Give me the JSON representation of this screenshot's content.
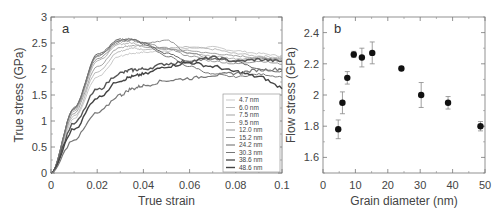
{
  "chart_data": [
    {
      "type": "line",
      "panel_label": "a",
      "title": "",
      "xlabel": "True strain",
      "ylabel": "True stress (GPa)",
      "xlim": [
        0,
        0.1
      ],
      "ylim": [
        0,
        3
      ],
      "xticks": [
        "0",
        "0.02",
        "0.04",
        "0.06",
        "0.08",
        "0.1"
      ],
      "yticks": [
        "0",
        "0.5",
        "1",
        "1.5",
        "2",
        "2.5",
        "3"
      ],
      "grid": false,
      "legend_position": "lower right",
      "x": [
        0,
        0.01,
        0.02,
        0.03,
        0.035,
        0.04,
        0.05,
        0.06,
        0.07,
        0.08,
        0.09,
        0.1
      ],
      "series": [
        {
          "name": "4.7 nm",
          "color": "#bbbbbb",
          "width": 0.8,
          "values": [
            0,
            1.05,
            1.85,
            2.25,
            2.3,
            2.32,
            2.35,
            2.4,
            2.42,
            2.35,
            2.3,
            2.25
          ]
        },
        {
          "name": "6.0 nm",
          "color": "#aaaaaa",
          "width": 0.8,
          "values": [
            0,
            1.1,
            1.95,
            2.35,
            2.4,
            2.38,
            2.4,
            2.42,
            2.38,
            2.3,
            2.25,
            2.22
          ]
        },
        {
          "name": "7.5 nm",
          "color": "#999999",
          "width": 0.9,
          "values": [
            0,
            1.15,
            2.05,
            2.42,
            2.45,
            2.43,
            2.38,
            2.35,
            2.3,
            2.25,
            2.22,
            2.2
          ]
        },
        {
          "name": "9.5 nm",
          "color": "#a0a0a0",
          "width": 0.8,
          "values": [
            0,
            1.2,
            2.15,
            2.48,
            2.5,
            2.45,
            2.4,
            2.3,
            2.25,
            2.2,
            2.2,
            2.18
          ]
        },
        {
          "name": "12.0 nm",
          "color": "#8a8a8a",
          "width": 0.9,
          "values": [
            0,
            1.22,
            2.2,
            2.52,
            2.55,
            2.5,
            2.55,
            2.3,
            2.2,
            2.15,
            2.2,
            2.15
          ]
        },
        {
          "name": "15.2 nm",
          "color": "#909090",
          "width": 0.9,
          "values": [
            0,
            1.25,
            2.25,
            2.55,
            2.57,
            2.5,
            2.4,
            2.25,
            2.15,
            2.1,
            2.15,
            2.1
          ]
        },
        {
          "name": "24.2 nm",
          "color": "#666666",
          "width": 1.0,
          "values": [
            0,
            1.25,
            2.28,
            2.57,
            2.58,
            2.5,
            2.3,
            2.15,
            2.2,
            2.15,
            2.0,
            1.95
          ]
        },
        {
          "name": "30.3 nm",
          "color": "#777777",
          "width": 1.0,
          "values": [
            0,
            1.25,
            2.25,
            2.55,
            2.57,
            2.48,
            2.25,
            2.05,
            1.9,
            1.85,
            1.9,
            1.85
          ]
        },
        {
          "name": "38.6 nm",
          "color": "#555555",
          "width": 1.4,
          "values": [
            0,
            0.95,
            1.6,
            1.92,
            1.98,
            2.0,
            2.1,
            2.15,
            2.22,
            2.15,
            2.18,
            2.15
          ]
        },
        {
          "name": "48.6 nm",
          "color": "#444444",
          "width": 1.4,
          "values": [
            0,
            0.85,
            1.45,
            1.78,
            1.85,
            1.9,
            2.05,
            2.12,
            2.05,
            1.95,
            1.85,
            1.65
          ]
        },
        {
          "name": "(lowest curve)",
          "color": "#777777",
          "width": 1.2,
          "values": [
            0,
            0.65,
            1.15,
            1.5,
            1.62,
            1.68,
            1.78,
            1.82,
            1.88,
            1.92,
            1.98,
            2.0
          ]
        }
      ]
    },
    {
      "type": "scatter",
      "panel_label": "b",
      "title": "",
      "xlabel": "Grain diameter (nm)",
      "ylabel": "Flow stress (GPa)",
      "xlim": [
        0,
        50
      ],
      "ylim": [
        1.5,
        2.5
      ],
      "xticks": [
        "0",
        "10",
        "20",
        "30",
        "40",
        "50"
      ],
      "yticks": [
        "1.6",
        "1.8",
        "2",
        "2.2",
        "2.4"
      ],
      "grid": false,
      "x": [
        4.7,
        6.0,
        7.5,
        9.5,
        12.0,
        15.2,
        24.2,
        30.3,
        38.6,
        48.6
      ],
      "values": [
        1.78,
        1.95,
        2.11,
        2.26,
        2.24,
        2.27,
        2.17,
        2.0,
        1.95,
        1.8
      ],
      "errors": [
        0.06,
        0.07,
        0.04,
        0.02,
        0.06,
        0.07,
        0.01,
        0.08,
        0.04,
        0.03
      ]
    }
  ]
}
